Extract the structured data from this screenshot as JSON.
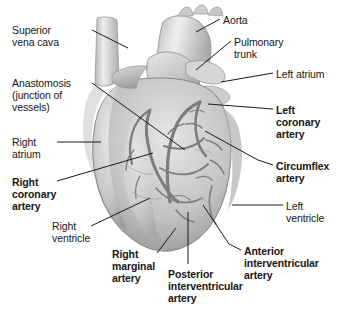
{
  "figure": {
    "style": "grayscale anatomical illustration with leader-line callouts",
    "width": 337,
    "height": 311,
    "background_color": "#ffffff",
    "text_color": "#161616",
    "leader_line_color": "#1a1a1a"
  },
  "palette": {
    "myocardium_light": "#e2e2e2",
    "myocardium_mid": "#c4c4c4",
    "myocardium_dark": "#9a9a9a",
    "vessel_gray": "#8a8a8a",
    "vessel_dark": "#6e6e6e",
    "outline": "#7d7d7d",
    "highlight": "#f2f2f2"
  },
  "labels": [
    {
      "id": "superior-vena-cava",
      "lines": [
        "Superior",
        "vena cava"
      ],
      "bold": false,
      "align": "left",
      "x": 12,
      "y": 24,
      "leader": [
        [
          92,
          30
        ],
        [
          128,
          48
        ]
      ]
    },
    {
      "id": "anastomosis",
      "lines": [
        "Anastomosis",
        "(junction of",
        "vessels)"
      ],
      "bold": false,
      "align": "left",
      "x": 12,
      "y": 77,
      "leader": [
        [
          92,
          83
        ],
        [
          185,
          150
        ]
      ]
    },
    {
      "id": "right-atrium",
      "lines": [
        "Right",
        "atrium"
      ],
      "bold": false,
      "align": "left",
      "x": 12,
      "y": 136,
      "leader": [
        [
          57,
          142
        ],
        [
          101,
          142
        ]
      ]
    },
    {
      "id": "right-coronary-artery",
      "lines": [
        "Right",
        "coronary",
        "artery"
      ],
      "bold": true,
      "align": "left",
      "x": 12,
      "y": 176,
      "leader": [
        [
          57,
          181
        ],
        [
          153,
          153
        ]
      ]
    },
    {
      "id": "right-ventricle",
      "lines": [
        "Right",
        "ventricle"
      ],
      "bold": false,
      "align": "left",
      "x": 52,
      "y": 220,
      "leader": [
        [
          91,
          226
        ],
        [
          150,
          198
        ]
      ]
    },
    {
      "id": "right-marginal-artery",
      "lines": [
        "Right",
        "marginal",
        "artery"
      ],
      "bold": true,
      "align": "left",
      "x": 112,
      "y": 248,
      "leader": [
        [
          157,
          253
        ],
        [
          176,
          228
        ]
      ]
    },
    {
      "id": "posterior-interventricular-artery",
      "lines": [
        "Posterior",
        "interventricular",
        "artery"
      ],
      "bold": true,
      "align": "left",
      "x": 168,
      "y": 268,
      "leader": [
        [
          188,
          264
        ],
        [
          188,
          212
        ]
      ]
    },
    {
      "id": "aorta",
      "lines": [
        "Aorta"
      ],
      "bold": false,
      "align": "left",
      "x": 223,
      "y": 14,
      "leader": [
        [
          220,
          19
        ],
        [
          196,
          32
        ]
      ]
    },
    {
      "id": "pulmonary-trunk",
      "lines": [
        "Pulmonary",
        "trunk"
      ],
      "bold": false,
      "align": "left",
      "x": 234,
      "y": 36,
      "leader": [
        [
          231,
          41
        ],
        [
          196,
          70
        ]
      ]
    },
    {
      "id": "left-atrium",
      "lines": [
        "Left atrium"
      ],
      "bold": false,
      "align": "left",
      "x": 276,
      "y": 68,
      "leader": [
        [
          273,
          73
        ],
        [
          221,
          82
        ]
      ]
    },
    {
      "id": "left-coronary-artery",
      "lines": [
        "Left",
        "coronary",
        "artery"
      ],
      "bold": true,
      "align": "left",
      "x": 276,
      "y": 104,
      "leader": [
        [
          273,
          109
        ],
        [
          208,
          104
        ]
      ]
    },
    {
      "id": "circumflex-artery",
      "lines": [
        "Circumflex",
        "artery"
      ],
      "bold": true,
      "align": "left",
      "x": 276,
      "y": 160,
      "leader": [
        [
          273,
          165
        ],
        [
          258,
          160
        ],
        [
          205,
          131
        ]
      ]
    },
    {
      "id": "left-ventricle",
      "lines": [
        "Left",
        "ventricle"
      ],
      "bold": false,
      "align": "left",
      "x": 286,
      "y": 200,
      "leader": [
        [
          283,
          205
        ],
        [
          232,
          205
        ]
      ]
    },
    {
      "id": "anterior-interventricular-artery",
      "lines": [
        "Anterior",
        "interventricular",
        "artery"
      ],
      "bold": true,
      "align": "left",
      "x": 244,
      "y": 245,
      "leader": [
        [
          241,
          250
        ],
        [
          229,
          244
        ],
        [
          203,
          205
        ]
      ]
    }
  ]
}
